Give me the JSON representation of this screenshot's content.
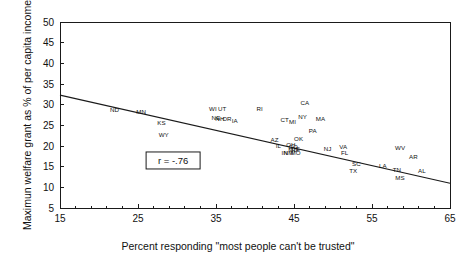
{
  "chart_data": {
    "type": "scatter",
    "title": "",
    "xlabel": "Percent responding \"most people can't be trusted\"",
    "ylabel": "Maximun welfare grant as % of per capita income",
    "xlim": [
      15,
      65
    ],
    "ylim": [
      5,
      50
    ],
    "xticks": [
      15,
      25,
      35,
      45,
      55,
      65
    ],
    "yticks": [
      5,
      10,
      15,
      20,
      25,
      30,
      35,
      40,
      45,
      50
    ],
    "grid": false,
    "legend": "none",
    "annotations": [
      {
        "name": "correlation-annotation",
        "text": "r = -.76",
        "x": 29.5,
        "y": 16.5,
        "boxed": true
      }
    ],
    "trendline": {
      "name": "regression-line",
      "x0": 15,
      "y0": 32.3,
      "x1": 65,
      "y1": 11.0
    },
    "point_label_field": "state",
    "points": [
      {
        "state": "ND",
        "x": 22.0,
        "y": 28.8
      },
      {
        "state": "MN",
        "x": 25.4,
        "y": 28.2
      },
      {
        "state": "KS",
        "x": 28.0,
        "y": 25.5
      },
      {
        "state": "WY",
        "x": 28.3,
        "y": 22.6
      },
      {
        "state": "WI",
        "x": 34.6,
        "y": 28.9
      },
      {
        "state": "UT",
        "x": 35.8,
        "y": 28.9
      },
      {
        "state": "NE",
        "x": 35.0,
        "y": 26.9
      },
      {
        "state": "NH",
        "x": 35.5,
        "y": 26.7
      },
      {
        "state": "OR",
        "x": 36.4,
        "y": 26.7
      },
      {
        "state": "IA",
        "x": 37.4,
        "y": 26.0
      },
      {
        "state": "RI",
        "x": 40.6,
        "y": 29.1
      },
      {
        "state": "CA",
        "x": 46.4,
        "y": 30.4
      },
      {
        "state": "CT",
        "x": 43.8,
        "y": 26.4
      },
      {
        "state": "MI",
        "x": 44.8,
        "y": 25.8
      },
      {
        "state": "NY",
        "x": 46.1,
        "y": 27.0
      },
      {
        "state": "MA",
        "x": 48.4,
        "y": 26.5
      },
      {
        "state": "PA",
        "x": 47.4,
        "y": 23.7
      },
      {
        "state": "AZ",
        "x": 42.5,
        "y": 21.5
      },
      {
        "state": "OK",
        "x": 45.6,
        "y": 21.7
      },
      {
        "state": "IL",
        "x": 43.0,
        "y": 20.1
      },
      {
        "state": "OH",
        "x": 44.6,
        "y": 20.4
      },
      {
        "state": "CO",
        "x": 44.9,
        "y": 19.7
      },
      {
        "state": "MD",
        "x": 44.9,
        "y": 19.0
      },
      {
        "state": "DE",
        "x": 45.2,
        "y": 19.3
      },
      {
        "state": "IN",
        "x": 43.8,
        "y": 18.4
      },
      {
        "state": "NM",
        "x": 44.3,
        "y": 18.4
      },
      {
        "state": "MO",
        "x": 45.2,
        "y": 18.3
      },
      {
        "state": "NJ",
        "x": 49.3,
        "y": 19.3
      },
      {
        "state": "VA",
        "x": 51.3,
        "y": 19.8
      },
      {
        "state": "FL",
        "x": 51.5,
        "y": 18.4
      },
      {
        "state": "SC",
        "x": 53.0,
        "y": 15.6
      },
      {
        "state": "TX",
        "x": 52.6,
        "y": 14.1
      },
      {
        "state": "LA",
        "x": 56.4,
        "y": 15.2
      },
      {
        "state": "TN",
        "x": 58.2,
        "y": 14.2
      },
      {
        "state": "MS",
        "x": 58.6,
        "y": 12.4
      },
      {
        "state": "WV",
        "x": 58.6,
        "y": 19.6
      },
      {
        "state": "AR",
        "x": 60.3,
        "y": 17.5
      },
      {
        "state": "AL",
        "x": 61.4,
        "y": 13.9
      }
    ]
  }
}
